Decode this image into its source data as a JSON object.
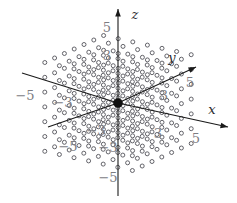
{
  "figure": {
    "background_color": "#ffffff",
    "axis_color": "#1a1a1a",
    "tick_label_color": "#7c7c82",
    "dot_color": "#4a4a52",
    "origin_color": "#111111"
  },
  "chart_data": {
    "type": "scatter",
    "title": "",
    "xlabel": "x",
    "ylabel": "y",
    "zlabel": "z",
    "grid": false,
    "legend": "none",
    "projection": "oblique-3d",
    "axes": [
      {
        "name": "x",
        "label": "x",
        "label_position": {
          "x": 212,
          "y": 110
        },
        "arrow": true,
        "start": {
          "x": 118,
          "y": 103
        },
        "end": {
          "x": 228,
          "y": 127
        },
        "ticks": [
          {
            "value": "3",
            "x": 158,
            "y": 134
          },
          {
            "value": "5",
            "x": 196,
            "y": 139
          }
        ]
      },
      {
        "name": "x-negative",
        "label": "",
        "arrow": false,
        "start": {
          "x": 118,
          "y": 103
        },
        "end": {
          "x": 48,
          "y": 127
        },
        "ticks": [
          {
            "value": "-3",
            "x": 96,
            "y": 131
          },
          {
            "value": "-5",
            "x": 68,
            "y": 147
          }
        ]
      },
      {
        "name": "y",
        "label": "y",
        "label_position": {
          "x": 172,
          "y": 58
        },
        "arrow": true,
        "start": {
          "x": 118,
          "y": 103
        },
        "end": {
          "x": 196,
          "y": 67
        },
        "ticks": [
          {
            "value": "3",
            "x": 164,
            "y": 96
          },
          {
            "value": "5",
            "x": 190,
            "y": 83
          }
        ]
      },
      {
        "name": "y-negative",
        "label": "",
        "arrow": false,
        "start": {
          "x": 118,
          "y": 103
        },
        "end": {
          "x": 22,
          "y": 73
        },
        "ticks": [
          {
            "value": "-5",
            "x": 25,
            "y": 96
          },
          {
            "value": "-3",
            "x": 63,
            "y": 103
          }
        ]
      },
      {
        "name": "z",
        "label": "z",
        "label_position": {
          "x": 135,
          "y": 15
        },
        "arrow": true,
        "start": {
          "x": 118,
          "y": 103
        },
        "end": {
          "x": 118,
          "y": 9
        },
        "ticks": [
          {
            "value": "5",
            "x": 107,
            "y": 28
          },
          {
            "value": "3",
            "x": 107,
            "y": 56
          }
        ]
      },
      {
        "name": "z-negative",
        "label": "",
        "arrow": false,
        "start": {
          "x": 118,
          "y": 103
        },
        "end": {
          "x": 118,
          "y": 196
        },
        "ticks": [
          {
            "value": "-3",
            "x": 108,
            "y": 148
          },
          {
            "value": "-5",
            "x": 108,
            "y": 178
          }
        ]
      }
    ],
    "origin": {
      "x": 118,
      "y": 103,
      "radius": 4.6,
      "label": ""
    },
    "lattice": {
      "description": "Sheared grid of small open circles representing projected integer lattice points",
      "dot_radius": 2.0,
      "origin_px": {
        "x": 118,
        "y": 103
      },
      "basis_x_px": {
        "dx": 14.6,
        "dy": 3.2
      },
      "basis_y_px": {
        "dx": 9.8,
        "dy": -4.5
      },
      "basis_z_px": {
        "dx": 0.0,
        "dy": -14.8
      },
      "i_range": [
        -3,
        3
      ],
      "j_range": [
        -3,
        3
      ],
      "k_range": [
        -3,
        3
      ],
      "clip_box": {
        "x": 26,
        "y": 8,
        "width": 196,
        "height": 186
      }
    }
  }
}
